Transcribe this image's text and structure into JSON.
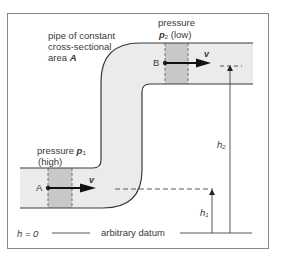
{
  "diagram": {
    "pipe_label": {
      "line1": "pipe of constant",
      "line2": "cross-sectional",
      "line3_prefix": "area ",
      "line3_symbol": "A"
    },
    "point_b": {
      "label": "B",
      "pressure_word": "pressure",
      "pressure_symbol": "p",
      "pressure_subscript": "2",
      "pressure_note": "(low)",
      "velocity": "v"
    },
    "point_a": {
      "label": "A",
      "pressure_word": "pressure",
      "pressure_symbol": "p",
      "pressure_subscript": "1",
      "pressure_note": "(high)",
      "velocity": "v"
    },
    "heights": {
      "h1_symbol": "h",
      "h1_subscript": "1",
      "h2_symbol": "h",
      "h2_subscript": "2"
    },
    "datum": {
      "h_zero": "h = 0",
      "label": "arbitrary datum"
    },
    "colors": {
      "pipe_fill": "#ebebeb",
      "band_fill": "#c8c8c8",
      "line": "#3a3a3a",
      "frame": "#8a8a8a"
    }
  }
}
